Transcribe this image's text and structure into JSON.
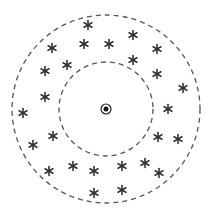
{
  "diagram": {
    "center": {
      "x": 106,
      "y": 109,
      "symbol": "circled-dot",
      "outer_r": 5,
      "dot_r": 2.5
    },
    "outer_circle": {
      "cx": 106,
      "cy": 109,
      "r": 94,
      "style": "dashed"
    },
    "inner_circle": {
      "cx": 106,
      "cy": 109,
      "r": 47,
      "style": "dashed"
    },
    "marker_glyph": "*",
    "stroke_color": "#555555",
    "marker_color": "#333333",
    "markers": [
      {
        "x": 88,
        "y": 25
      },
      {
        "x": 133,
        "y": 35
      },
      {
        "x": 52,
        "y": 48
      },
      {
        "x": 84,
        "y": 44
      },
      {
        "x": 109,
        "y": 44
      },
      {
        "x": 157,
        "y": 49
      },
      {
        "x": 133,
        "y": 60
      },
      {
        "x": 67,
        "y": 65
      },
      {
        "x": 45,
        "y": 71
      },
      {
        "x": 157,
        "y": 74
      },
      {
        "x": 183,
        "y": 88
      },
      {
        "x": 45,
        "y": 97
      },
      {
        "x": 23,
        "y": 113
      },
      {
        "x": 168,
        "y": 109
      },
      {
        "x": 53,
        "y": 136
      },
      {
        "x": 33,
        "y": 145
      },
      {
        "x": 158,
        "y": 137
      },
      {
        "x": 178,
        "y": 139
      },
      {
        "x": 49,
        "y": 171
      },
      {
        "x": 73,
        "y": 166
      },
      {
        "x": 94,
        "y": 171
      },
      {
        "x": 122,
        "y": 166
      },
      {
        "x": 145,
        "y": 163
      },
      {
        "x": 159,
        "y": 173
      },
      {
        "x": 94,
        "y": 193
      },
      {
        "x": 122,
        "y": 190
      }
    ]
  }
}
